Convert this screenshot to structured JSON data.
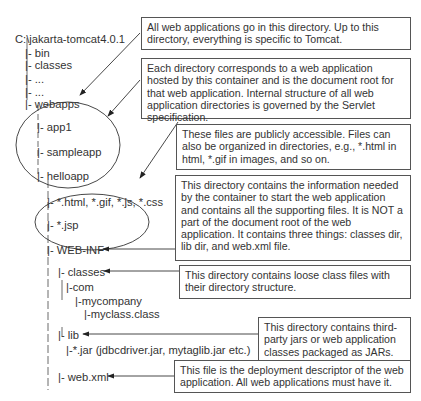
{
  "tree": {
    "root": "C:\\jakarta-tomcat4.0.1",
    "items": [
      "|- bin",
      "|- classes",
      "|- ...",
      "|- ...",
      "|- webapps",
      "|- app1",
      "|- sampleapp",
      "|- helloapp",
      "|- *.html, *.gif, *.js, *.css",
      "|- *.jsp",
      "|- WEB-INF",
      "|- classes",
      "|-com",
      "|-mycompany",
      "|-myclass.class",
      "|- lib",
      "|-*.jar (jdbcdriver.jar, mytaglib.jar etc.)",
      "|- web.xml"
    ]
  },
  "callouts": [
    "All web applications go in this directory. Up to this directory, everything is specific to Tomcat.",
    "Each directory corresponds to a web application hosted by this container and is the document root for that web application. Internal structure of all web application directories is governed by the Servlet specification.",
    "These files are publicly accessible. Files can also be organized in directories, e.g., *.html in html, *.gif in images, and so on.",
    "This directory contains the information needed by the container to start the web application and contains all  the supporting files. It is NOT a part of the document root of the web application. It contains three things: classes dir, lib dir, and web.xml file.",
    "This directory contains loose class files with their directory structure.",
    "This directory contains third-party jars or web application classes packaged as JARs.",
    "This file is the deployment descriptor of the web application. All web applications must have it."
  ]
}
